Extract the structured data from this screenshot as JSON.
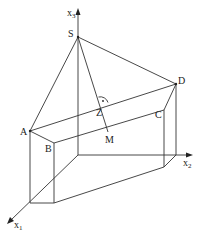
{
  "diagram": {
    "type": "3d-geometry-pyramid-on-prism",
    "axes": {
      "x1": {
        "label": "x",
        "subscript": "1"
      },
      "x2": {
        "label": "x",
        "subscript": "2"
      },
      "x3": {
        "label": "x",
        "subscript": "3"
      }
    },
    "points": {
      "S": "S",
      "D": "D",
      "A": "A",
      "B": "B",
      "C": "C",
      "Z": "Z",
      "M": "M"
    },
    "right_angle_mark": "·",
    "colors": {
      "line": "#333333",
      "text": "#222222",
      "background": "#ffffff"
    }
  }
}
